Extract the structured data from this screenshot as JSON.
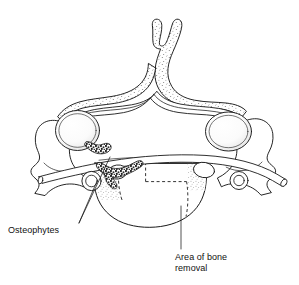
{
  "figure": {
    "kind": "anatomical-illustration",
    "background_color": "#ffffff",
    "line_color": "#1a1a1a",
    "stipple_color": "#555555",
    "osteophyte_color": "#2a2a2a",
    "width": 299,
    "height": 285
  },
  "labels": {
    "osteophytes": {
      "text": "Osteophytes",
      "x": 8,
      "y": 225
    },
    "bone_removal": {
      "line1": "Area of bone",
      "line2": "removal",
      "x": 175,
      "y": 252
    }
  },
  "annotations": {
    "leader_lines": [
      {
        "name": "osteophytes-leader-upper",
        "from": [
          78,
          224
        ],
        "to": [
          108,
          160
        ]
      },
      {
        "name": "osteophytes-leader-lower",
        "from": [
          78,
          224
        ],
        "to": [
          96,
          182
        ]
      },
      {
        "name": "bone-removal-leader",
        "from": [
          182,
          249
        ],
        "to": [
          182,
          208
        ]
      }
    ],
    "dashed_region": {
      "name": "area-of-bone-removal-outline",
      "style": "dashed",
      "dash_pattern": "3 2.5"
    }
  },
  "structures": [
    {
      "name": "spinous-process",
      "note": "bifid, stippled"
    },
    {
      "name": "vertebral-foramen",
      "note": "spinal canal, double outline"
    },
    {
      "name": "lamina-left"
    },
    {
      "name": "lamina-right"
    },
    {
      "name": "superior-articular-facet-left"
    },
    {
      "name": "superior-articular-facet-right"
    },
    {
      "name": "transverse-process-left"
    },
    {
      "name": "transverse-process-right"
    },
    {
      "name": "transverse-foramen-left"
    },
    {
      "name": "transverse-foramen-right"
    },
    {
      "name": "vertebral-body",
      "note": "stippled cut surface"
    },
    {
      "name": "osteophyte-mass-left"
    },
    {
      "name": "osteophyte-mass-central"
    },
    {
      "name": "nerve-root-tube",
      "note": "cylindrical structure crossing image"
    }
  ]
}
